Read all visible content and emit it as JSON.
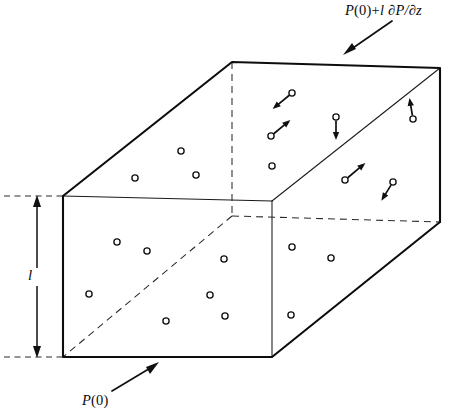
{
  "figure": {
    "background_color": "#ffffff",
    "line_color": "#0d0d0d",
    "width": 457,
    "height": 420
  },
  "labels": {
    "top_pressure": "P(0)+l ∂P/∂z",
    "top_pressure_parts": {
      "symbol": "P",
      "argument": "(0)",
      "plus": "+",
      "length": "l",
      "derivative": "∂P/∂z"
    },
    "bottom_pressure": "P(0)",
    "height_symbol": "l"
  },
  "annotations": [
    {
      "name": "top-pressure-callout",
      "label": "P(0)+l ∂P/∂z",
      "arrow_from": [
        392,
        21
      ],
      "arrow_to": [
        344,
        54
      ],
      "points_at": "top-face"
    },
    {
      "name": "bottom-pressure-callout",
      "label": "P(0)",
      "arrow_from": [
        112,
        391
      ],
      "arrow_to": [
        158,
        363
      ],
      "points_at": "bottom-face"
    }
  ],
  "dimension": {
    "name": "height-dimension",
    "symbol": "l",
    "top_y": 196,
    "bottom_y": 357,
    "x": 37,
    "guides": [
      {
        "y": 196,
        "x1": 4,
        "x2": 66
      },
      {
        "y": 357,
        "x1": 4,
        "x2": 66
      }
    ]
  },
  "box": {
    "description": "Rectangular fluid element drawn in oblique projection",
    "vertices": {
      "front_top_left": [
        63,
        196
      ],
      "front_top_right": [
        272,
        201
      ],
      "front_bottom_left": [
        63,
        357
      ],
      "front_bottom_right": [
        272,
        357
      ],
      "back_top_left": [
        232,
        62
      ],
      "back_top_right": [
        440,
        68
      ],
      "back_bottom_left": [
        232,
        216
      ],
      "back_bottom_right": [
        440,
        222
      ]
    },
    "solid_edges": [
      "front_top_left -> back_top_left",
      "back_top_left -> back_top_right",
      "back_top_right -> back_bottom_right",
      "back_bottom_right -> front_bottom_right",
      "front_bottom_right -> front_bottom_left",
      "front_bottom_left -> front_top_left"
    ],
    "thin_edges": [
      "front_top_left -> front_top_right",
      "front_top_right -> front_bottom_right",
      "front_top_right -> back_top_right"
    ],
    "hidden_edges": [
      "back_top_left -> back_bottom_left",
      "back_bottom_left -> back_bottom_right",
      "back_bottom_left -> front_bottom_left"
    ]
  },
  "molecules": {
    "plain_count": 13,
    "with_velocity_count": 6,
    "radius": 3.1,
    "plain": [
      {
        "name": "molecule-top-1",
        "x": 135,
        "y": 178
      },
      {
        "name": "molecule-top-2",
        "x": 181,
        "y": 151
      },
      {
        "name": "molecule-top-3",
        "x": 196,
        "y": 175
      },
      {
        "name": "molecule-back-1",
        "x": 272,
        "y": 166
      },
      {
        "name": "molecule-front-1",
        "x": 117,
        "y": 242
      },
      {
        "name": "molecule-front-2",
        "x": 147,
        "y": 251
      },
      {
        "name": "molecule-front-3",
        "x": 224,
        "y": 259
      },
      {
        "name": "molecule-front-4",
        "x": 89,
        "y": 294
      },
      {
        "name": "molecule-front-5",
        "x": 210,
        "y": 295
      },
      {
        "name": "molecule-front-6",
        "x": 166,
        "y": 321
      },
      {
        "name": "molecule-front-7",
        "x": 225,
        "y": 316
      },
      {
        "name": "molecule-right-1",
        "x": 292,
        "y": 247
      },
      {
        "name": "molecule-right-2",
        "x": 331,
        "y": 258
      },
      {
        "name": "molecule-right-3",
        "x": 291,
        "y": 315
      }
    ],
    "with_velocity": [
      {
        "name": "molecule-vel-1",
        "x": 292,
        "y": 93,
        "vx": -17,
        "vy": 14
      },
      {
        "name": "molecule-vel-2",
        "x": 271,
        "y": 136,
        "vx": 17,
        "vy": -14
      },
      {
        "name": "molecule-vel-3",
        "x": 336,
        "y": 117,
        "vx": 0,
        "vy": 20
      },
      {
        "name": "molecule-vel-4",
        "x": 413,
        "y": 119,
        "vx": -3,
        "vy": -18
      },
      {
        "name": "molecule-vel-5",
        "x": 345,
        "y": 180,
        "vx": 18,
        "vy": -15
      },
      {
        "name": "molecule-vel-6",
        "x": 393,
        "y": 182,
        "vx": -10,
        "vy": 16
      }
    ]
  }
}
